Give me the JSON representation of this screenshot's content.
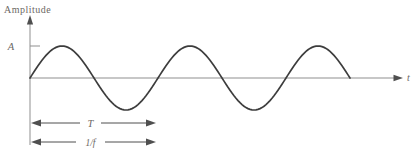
{
  "figure": {
    "y_axis_title": "Amplitude",
    "x_axis_label": "t",
    "amplitude_marker": "A",
    "period_marker": "T",
    "inverse_frequency_marker": "1/f"
  },
  "chart_data": {
    "type": "line",
    "waveform": "sine",
    "ylabel": "Amplitude",
    "xlabel": "t",
    "amplitude": "A",
    "period": "T",
    "period_equals": "1/f",
    "cycles_shown": 2.5,
    "starts_at_origin": true,
    "annotations": [
      "A marks peak amplitude on y-axis",
      "T double arrow spans one period",
      "1/f double arrow spans one period"
    ],
    "geometry": {
      "start_x": 30,
      "baseline_y": 78,
      "amplitude_px": 32,
      "period_px": 128,
      "step_px": 2
    }
  },
  "colors": {
    "background": "#ffffff",
    "curve": "#3d3d3d",
    "axis": "#8f8f8f",
    "dimension_arrow": "#4f4f4f",
    "text": "#6c6864"
  }
}
